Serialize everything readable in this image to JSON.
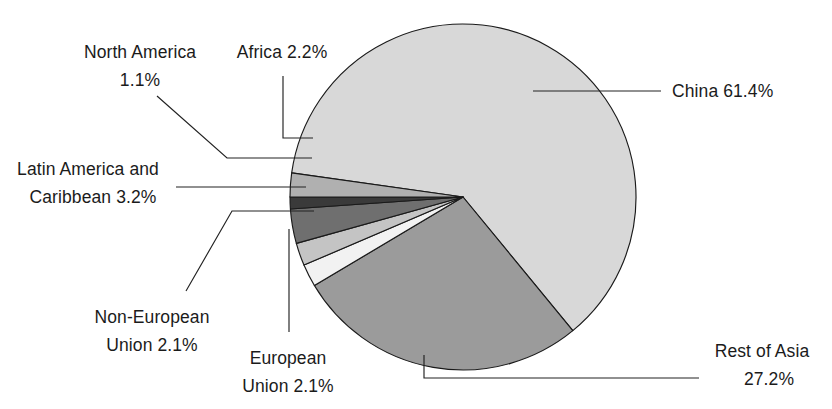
{
  "chart_data": {
    "type": "pie",
    "title": "",
    "subtitle": "",
    "xlabel": "",
    "ylabel": "",
    "legend_position": "none",
    "grid": false,
    "units": "percent",
    "total": 99.3,
    "categories": [
      "China",
      "Rest of Asia",
      "European Union",
      "Non-European Union",
      "Latin America and Caribbean",
      "North America",
      "Africa"
    ],
    "values": [
      61.4,
      27.2,
      2.1,
      2.1,
      3.2,
      1.1,
      2.2
    ],
    "colors": [
      "#d8d8d8",
      "#9b9b9b",
      "#f2f2f2",
      "#c4c4c4",
      "#6f6f6f",
      "#3a3a3a",
      "#b0b0b0"
    ],
    "slices": [
      {
        "name": "China",
        "value": 61.4,
        "label": "China 61.4%",
        "color": "#d8d8d8"
      },
      {
        "name": "Rest of Asia",
        "value": 27.2,
        "label": "Rest of Asia",
        "color": "#9b9b9b"
      },
      {
        "name": "European Union",
        "value": 2.1,
        "label": "European",
        "color": "#f2f2f2"
      },
      {
        "name": "Non-European Union",
        "value": 2.1,
        "label": "Non-European",
        "color": "#c4c4c4"
      },
      {
        "name": "Latin America and Caribbean",
        "value": 3.2,
        "label": "Latin America and",
        "color": "#6f6f6f"
      },
      {
        "name": "North America",
        "value": 1.1,
        "label": "North America",
        "color": "#3a3a3a"
      },
      {
        "name": "Africa",
        "value": 2.2,
        "label": "Africa 2.2%",
        "color": "#b0b0b0"
      }
    ]
  },
  "labels": {
    "china": {
      "line1": "China 61.4%"
    },
    "rest_of_asia": {
      "line1": "Rest of Asia",
      "line2": "27.2%"
    },
    "european_union": {
      "line1": "European",
      "line2": "Union 2.1%"
    },
    "non_european": {
      "line1": "Non-European",
      "line2": "Union 2.1%"
    },
    "latin_america": {
      "line1": "Latin America and",
      "line2": "Caribbean 3.2%"
    },
    "north_america": {
      "line1": "North America",
      "line2": "1.1%"
    },
    "africa": {
      "line1": "Africa 2.2%"
    }
  },
  "style": {
    "background": "#ffffff",
    "stroke": "#1a1a1a",
    "text_color": "#1b1b1b"
  }
}
